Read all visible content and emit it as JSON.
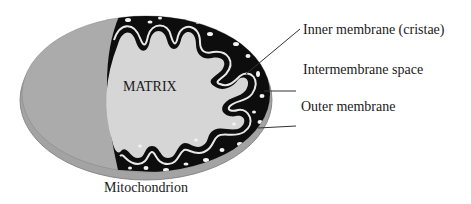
{
  "diagram": {
    "title": "Mitochondrion",
    "center_label": "MATRIX",
    "callouts": [
      {
        "label": "Inner membrane (cristae)"
      },
      {
        "label": "Intermembrane space"
      },
      {
        "label": "Outer membrane"
      }
    ],
    "colors": {
      "outer_membrane": "#a9a9a9",
      "outer_edge": "#8f8f8f",
      "intermembrane_dark": "#0d0d0d",
      "matrix": "#d6d6d6",
      "inner_membrane_line": "#e8e8e8",
      "leader_lines": "#333333",
      "background": "#ffffff"
    }
  }
}
